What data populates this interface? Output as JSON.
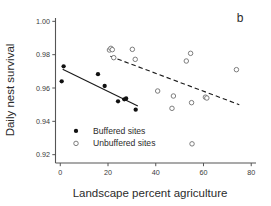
{
  "chart_data": {
    "type": "scatter",
    "title": "",
    "panel_label": "b",
    "xlabel": "Landscape percent agriculture",
    "ylabel": "Daily nest survival",
    "xlim": [
      -2,
      82
    ],
    "ylim": [
      0.915,
      1.002
    ],
    "xticks": [
      0,
      20,
      40,
      60,
      80
    ],
    "xtick_labels": [
      "0",
      "20",
      "40",
      "60",
      "80"
    ],
    "yticks": [
      0.92,
      0.94,
      0.96,
      0.98,
      1.0
    ],
    "ytick_labels": [
      "0.92",
      "0.94",
      "0.96",
      "0.98",
      "1.00"
    ],
    "grid": false,
    "legend_position": "lower-left-inside",
    "series": [
      {
        "name": "Buffered sites",
        "marker": "filled-circle",
        "marker_color": "#111111",
        "points": [
          {
            "x": 0.6,
            "y": 0.964
          },
          {
            "x": 1.4,
            "y": 0.973
          },
          {
            "x": 15.8,
            "y": 0.9683
          },
          {
            "x": 18.6,
            "y": 0.9612
          },
          {
            "x": 24.2,
            "y": 0.952
          },
          {
            "x": 26.8,
            "y": 0.9532
          },
          {
            "x": 27.6,
            "y": 0.9537
          },
          {
            "x": 31.6,
            "y": 0.947
          }
        ],
        "fit_line": {
          "style": "solid",
          "x_start": 1.0,
          "y_start": 0.9712,
          "x_end": 32.5,
          "y_end": 0.9492
        }
      },
      {
        "name": "Unbuffered sites",
        "marker": "open-circle",
        "marker_color": "#6f6f6f",
        "points": [
          {
            "x": 20.6,
            "y": 0.9828
          },
          {
            "x": 21.2,
            "y": 0.9838
          },
          {
            "x": 21.8,
            "y": 0.983
          },
          {
            "x": 22.4,
            "y": 0.9782
          },
          {
            "x": 30.2,
            "y": 0.9832
          },
          {
            "x": 31.4,
            "y": 0.9772
          },
          {
            "x": 40.8,
            "y": 0.9582
          },
          {
            "x": 46.8,
            "y": 0.9478
          },
          {
            "x": 47.4,
            "y": 0.9552
          },
          {
            "x": 52.8,
            "y": 0.9762
          },
          {
            "x": 54.6,
            "y": 0.9808
          },
          {
            "x": 55.0,
            "y": 0.9512
          },
          {
            "x": 55.2,
            "y": 0.9265
          },
          {
            "x": 60.8,
            "y": 0.9545
          },
          {
            "x": 61.4,
            "y": 0.954
          },
          {
            "x": 73.8,
            "y": 0.971
          }
        ],
        "fit_line": {
          "style": "dashed",
          "x_start": 21.0,
          "y_start": 0.979,
          "x_end": 75.0,
          "y_end": 0.95
        }
      }
    ]
  },
  "legend": {
    "entries": [
      {
        "label": "Buffered sites",
        "marker": "filled-circle"
      },
      {
        "label": "Unbuffered sites",
        "marker": "open-circle"
      }
    ]
  }
}
